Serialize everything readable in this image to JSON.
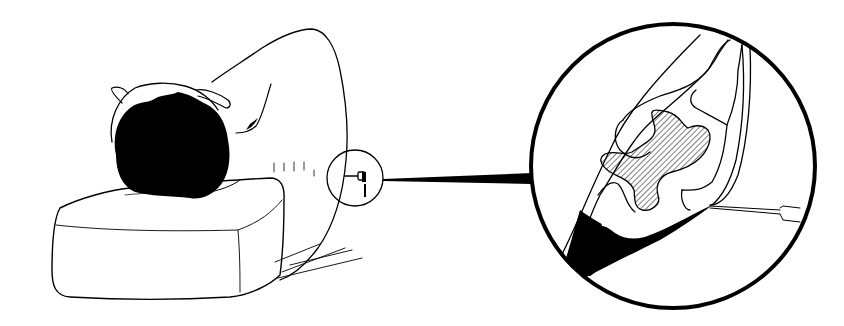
{
  "figure": {
    "colors": {
      "background": "#ffffff",
      "ink": "#000000"
    },
    "parts": [
      {
        "name": "pillow"
      },
      {
        "name": "patient-head"
      },
      {
        "name": "patient-back"
      },
      {
        "name": "puncture-site-circle"
      },
      {
        "name": "connector-line"
      },
      {
        "name": "magnified-detail-circle"
      },
      {
        "name": "vertebra-hatched"
      },
      {
        "name": "spinal-needle"
      }
    ]
  }
}
